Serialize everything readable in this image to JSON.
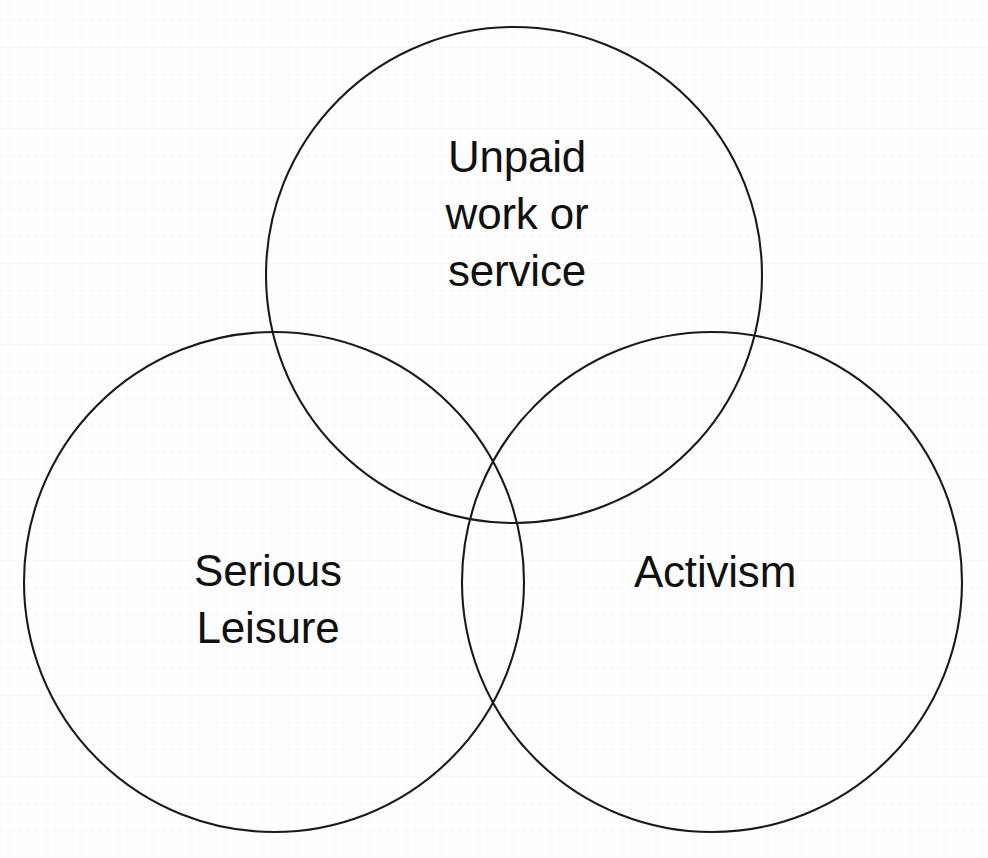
{
  "diagram": {
    "type": "venn-3-circle",
    "background_color": "#fefefe",
    "stroke_color": "#1a1a1a",
    "text_color": "#111111",
    "sets": [
      {
        "id": "unpaid-work-or-service",
        "label": "Unpaid\nwork or\nservice",
        "position": "top",
        "center_x": 514,
        "center_y": 275,
        "radius": 248
      },
      {
        "id": "serious-leisure",
        "label": "Serious\nLeisure",
        "position": "bottom-left",
        "center_x": 274,
        "center_y": 582,
        "radius": 250
      },
      {
        "id": "activism",
        "label": "Activism",
        "position": "bottom-right",
        "center_x": 712,
        "center_y": 582,
        "radius": 250
      }
    ]
  }
}
